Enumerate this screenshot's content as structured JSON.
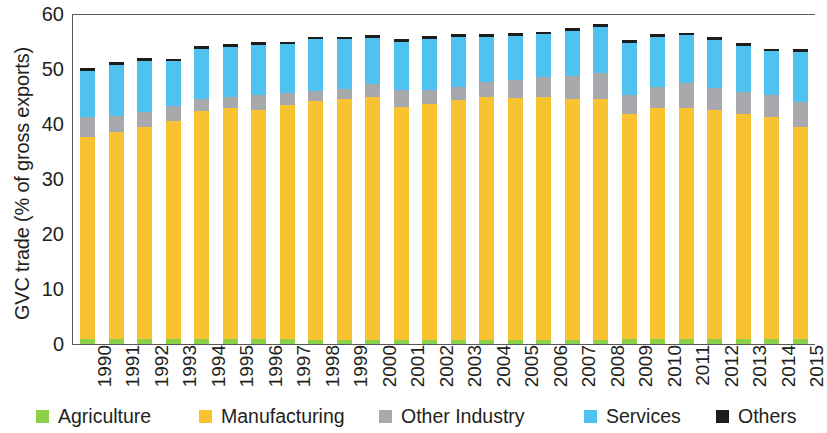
{
  "chart_data": {
    "type": "bar",
    "title": "",
    "subtitle": "",
    "stacked": true,
    "xlabel": "",
    "ylabel": "GVC trade (% of gross exports)",
    "ylim": [
      0,
      60
    ],
    "yticks": [
      0,
      10,
      20,
      30,
      40,
      50,
      60
    ],
    "grid": false,
    "legend_position": "bottom",
    "categories": [
      "1990",
      "1991",
      "1992",
      "1993",
      "1994",
      "1995",
      "1996",
      "1997",
      "1998",
      "1999",
      "2000",
      "2001",
      "2002",
      "2003",
      "2004",
      "2005",
      "2006",
      "2007",
      "2008",
      "2009",
      "2010",
      "2011",
      "2012",
      "2013",
      "2014",
      "2015"
    ],
    "series": [
      {
        "name": "Agriculture",
        "color": "#8dd04a",
        "values": [
          1.0,
          1.0,
          1.0,
          1.0,
          0.9,
          0.9,
          0.9,
          0.9,
          0.8,
          0.8,
          0.8,
          0.8,
          0.8,
          0.8,
          0.8,
          0.8,
          0.8,
          0.8,
          0.8,
          0.9,
          0.9,
          0.9,
          0.9,
          0.9,
          0.9,
          0.9
        ]
      },
      {
        "name": "Manufacturing",
        "color": "#f9c231",
        "values": [
          36.7,
          37.6,
          38.4,
          39.6,
          41.5,
          42.0,
          41.7,
          42.6,
          43.4,
          43.7,
          44.2,
          42.3,
          42.8,
          43.6,
          44.2,
          43.9,
          44.2,
          43.7,
          43.8,
          40.9,
          42.0,
          42.0,
          41.7,
          40.9,
          40.3,
          38.6
        ]
      },
      {
        "name": "Other Industry",
        "color": "#a8a9ad",
        "values": [
          3.6,
          2.9,
          2.8,
          2.6,
          2.1,
          2.0,
          2.7,
          2.2,
          1.8,
          1.9,
          2.3,
          3.0,
          2.5,
          2.4,
          2.6,
          3.3,
          3.6,
          4.2,
          4.6,
          3.4,
          3.8,
          4.5,
          4.0,
          4.1,
          4.0,
          4.5
        ]
      },
      {
        "name": "Services",
        "color": "#4fc2f0",
        "values": [
          8.4,
          9.2,
          9.3,
          8.2,
          9.2,
          9.1,
          9.1,
          8.8,
          9.4,
          9.0,
          8.4,
          8.9,
          9.4,
          9.0,
          8.3,
          8.0,
          7.7,
          8.2,
          8.4,
          9.6,
          9.2,
          8.7,
          8.7,
          8.3,
          8.0,
          9.1
        ]
      },
      {
        "name": "Others",
        "color": "#1d1d1b",
        "values": [
          0.5,
          0.5,
          0.5,
          0.5,
          0.5,
          0.5,
          0.5,
          0.5,
          0.5,
          0.5,
          0.5,
          0.5,
          0.5,
          0.5,
          0.5,
          0.5,
          0.5,
          0.5,
          0.5,
          0.5,
          0.5,
          0.5,
          0.5,
          0.5,
          0.5,
          0.5
        ]
      }
    ],
    "totals": [
      50.2,
      51.2,
      52.0,
      51.9,
      54.2,
      54.5,
      54.9,
      55.0,
      55.9,
      55.9,
      56.2,
      55.5,
      56.0,
      56.3,
      56.4,
      56.5,
      56.8,
      57.4,
      58.1,
      55.3,
      56.4,
      56.6,
      55.8,
      54.7,
      53.7,
      53.6
    ]
  },
  "axis": {
    "y_title": "GVC trade (% of gross exports)",
    "y_ticks": [
      "60",
      "50",
      "40",
      "30",
      "20",
      "10",
      "0"
    ],
    "x_ticks": [
      "1990",
      "1991",
      "1992",
      "1993",
      "1994",
      "1995",
      "1996",
      "1997",
      "1998",
      "1999",
      "2000",
      "2001",
      "2002",
      "2003",
      "2004",
      "2005",
      "2006",
      "2007",
      "2008",
      "2009",
      "2010",
      "2011",
      "2012",
      "2013",
      "2014",
      "2015"
    ]
  },
  "legend": {
    "items": [
      {
        "label": "Agriculture",
        "color": "#8dd04a",
        "icon": "square-swatch-icon"
      },
      {
        "label": "Manufacturing",
        "color": "#f9c231",
        "icon": "square-swatch-icon"
      },
      {
        "label": "Other Industry",
        "color": "#a8a9ad",
        "icon": "square-swatch-icon"
      },
      {
        "label": "Services",
        "color": "#4fc2f0",
        "icon": "square-swatch-icon"
      },
      {
        "label": "Others",
        "color": "#1d1d1b",
        "icon": "square-swatch-icon"
      }
    ]
  }
}
